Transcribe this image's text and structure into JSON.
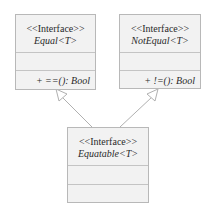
{
  "diagram": {
    "type": "uml-class",
    "colors": {
      "box_fill": "#f2f2f2",
      "box_border": "#b8b8b8",
      "line": "#b0b0b0",
      "text": "#2a2a2a"
    },
    "classes": [
      {
        "id": "equal",
        "stereotype": "<<Interface>>",
        "name": "Equal<T>",
        "attributes": [],
        "operations": [
          "+ ==(): Bool"
        ]
      },
      {
        "id": "notequal",
        "stereotype": "<<Interface>>",
        "name": "NotEqual<T>",
        "attributes": [],
        "operations": [
          "+ !=(): Bool"
        ]
      },
      {
        "id": "equatable",
        "stereotype": "<<Interface>>",
        "name": "Equatable<T>",
        "attributes": [],
        "operations": []
      }
    ],
    "relations": [
      {
        "type": "generalization",
        "from": "equatable",
        "to": "equal"
      },
      {
        "type": "generalization",
        "from": "equatable",
        "to": "notequal"
      }
    ]
  }
}
